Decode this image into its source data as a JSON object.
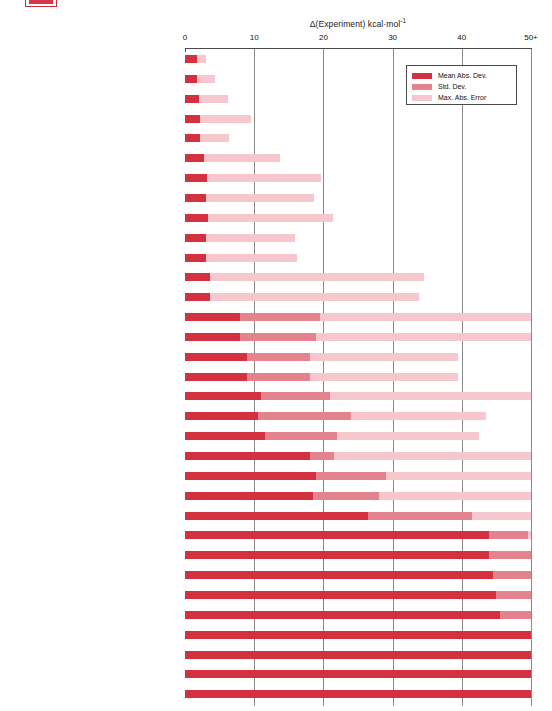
{
  "artifact": {
    "name": "clipped-legend-swatch"
  },
  "chart_data": {
    "type": "bar",
    "orientation": "horizontal",
    "stacked": true,
    "title": "",
    "xlabel": "Δ(Experiment) kcal·mol⁻¹",
    "xlabel_delta": "Δ(Experiment) kcal·mol",
    "xlabel_sup": "-1",
    "ylabel": "",
    "xlim": [
      0,
      50
    ],
    "xticks": [
      0,
      10,
      20,
      30,
      40,
      50
    ],
    "xticklabels": [
      "0",
      "10",
      "20",
      "30",
      "40",
      "50+"
    ],
    "grid": "vertical",
    "legend_position": "top-right",
    "colors": {
      "mean_abs_dev": "#d3313f",
      "std_dev": "#e4828e",
      "max_abs_error": "#f6c8ce",
      "gridline": "#8a8a8a",
      "axis": "#4a4a4a",
      "background": "#ffffff"
    },
    "series": [
      {
        "name": "Mean Abs. Dev.",
        "key": "mean_abs_dev",
        "color": "#d3313f"
      },
      {
        "name": "Std. Dev.",
        "key": "std_dev",
        "color": "#e4828e"
      },
      {
        "name": "Max. Abs. Error",
        "key": "max_abs_error",
        "color": "#f6c8ce"
      }
    ],
    "categories": [
      "CBS-Q",
      "G2",
      "G2(MP2)",
      "G1",
      "CBS-4",
      "B3LYP/6-311+G(3df,2df,2p) // B3LYP/6-31G(d)",
      "B3LYP/6-311+G(2d,p) // B3LYP/6-311+G(2d,p)",
      "B3LYP/6-311+G(2d,p) // B3LYP/6-31G(d)",
      "B3LYP/6-311+G(2d,p) // HF/3-21G(d)",
      "BLYP/6-31+G(d,p) // BLYP/6-31+G(d,p)",
      "BLYP/6-311+G(2d,p) // BLYP/6-311+G(2d,p)",
      "B3LYP/6-31+G(d,p) // B3LYP/6-31+G(d,p)",
      "B3LYP/6-31+G(d,p) // B3LYP/6-31G(d)",
      "B3LYP/6-31G(d) // B3LYP/6-31G(d)",
      "B3LYP/6-31G(d) // HF/3–21G(d)",
      "MP2/6-311+G(2d,p) // B3LYP/6-31G(d)",
      "MP2/6-311+G(2d,p) // MP2/6-311+G(2d,p)",
      "B3LYP/6-31G(d) // AM1",
      "MP2/6-31+G(d,p) // MP2/6-31+G(d,p)",
      "MP2/6-31+G(d,p) // HF/6-31G(d)",
      "PM3 // PM3",
      "SVWN5/6-311+G(2d,p) // SVWN5/6-311+G(2d,p)",
      "AM1 // AM1",
      "SVWN/6-311+G(2d,p) // SVWN/6-311+G(2d,p)",
      "HF/6-311+G(2d,p) // HF/6-31G(d)",
      "HF/6-311+G(2d,p) // B3LYP/6-31G(d)",
      "HF/6-31+G(d,p) // HF/6-31G(d)",
      "HF/6-31+G(d,p) // HF/6-31+G(d,p)",
      "HF/6-31+G(d,p) // AM1",
      "HF/6-31G(d) // HF/6-31G(d)",
      "HF/6-31G(d) // AM1",
      "HF/3-21G(d) // HF/3-21G(d)",
      "HF/STO-3G // HF/STO-3G"
    ],
    "values": {
      "mean_abs_dev": [
        1.7,
        1.7,
        2.0,
        2.2,
        2.2,
        2.8,
        3.2,
        3.1,
        3.3,
        3.0,
        3.0,
        3.6,
        3.6,
        8.0,
        8.0,
        9.0,
        9.0,
        11.0,
        10.5,
        11.5,
        18.0,
        19.0,
        18.5,
        26.5,
        44.0,
        44.0,
        44.5,
        45.0,
        45.5,
        50.0,
        50.0,
        50.0,
        50.0
      ],
      "std_dev": [
        1.0,
        1.2,
        1.5,
        1.8,
        1.6,
        2.0,
        2.5,
        2.2,
        2.5,
        2.8,
        2.8,
        2.5,
        2.5,
        19.5,
        19.0,
        18.0,
        18.0,
        21.0,
        24.0,
        22.0,
        21.5,
        29.0,
        28.0,
        41.5,
        49.5,
        50.0,
        50.0,
        50.0,
        50.0,
        50.0,
        50.0,
        50.0,
        50.0
      ],
      "max_abs_error": [
        3.0,
        4.4,
        6.2,
        9.6,
        6.4,
        13.8,
        19.6,
        18.7,
        21.4,
        15.9,
        16.2,
        34.5,
        33.8,
        50.0,
        50.0,
        39.5,
        39.5,
        50.0,
        43.5,
        42.5,
        50.0,
        50.0,
        50.0,
        50.0,
        50.0,
        50.0,
        50.0,
        50.0,
        50.0,
        50.0,
        50.0,
        50.0,
        50.0
      ]
    }
  },
  "legend": {
    "items": [
      {
        "label": "Mean Abs. Dev.",
        "key": "mad"
      },
      {
        "label": "Std. Dev.",
        "key": "std"
      },
      {
        "label": "Max. Abs. Error",
        "key": "max"
      }
    ]
  }
}
